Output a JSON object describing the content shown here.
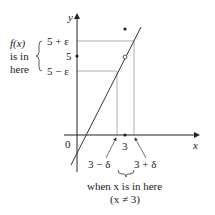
{
  "axes": {
    "x_label": "x",
    "y_label": "y",
    "origin_label": "0"
  },
  "y_ticks": {
    "upper": "5 + ε",
    "center": "5",
    "lower": "5 − ε"
  },
  "x_ticks": {
    "center": "3",
    "left": "3 − δ",
    "right": "3 + δ"
  },
  "left_annotation": {
    "line1": "f(x)",
    "line2": "is in",
    "line3": "here"
  },
  "bottom_annotation": {
    "line1": "when x is in here",
    "line2": "(x ≠ 3)"
  },
  "colors": {
    "axis": "#222222",
    "guide": "#888888",
    "curve": "#333333"
  }
}
